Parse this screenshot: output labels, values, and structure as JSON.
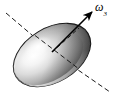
{
  "figure": {
    "type": "physics-diagram",
    "width": 115,
    "height": 99,
    "background_color": "#ffffff"
  },
  "ellipsoid": {
    "name": "shaded-ellipsoid",
    "center_x": 52,
    "center_y": 55,
    "semi_major": 42,
    "semi_minor": 27,
    "rotation_deg": -31,
    "outline_color": "#1a1a1a",
    "outline_width": 1.1,
    "highlight_color": "#ffffff",
    "midtone_color": "#c9c9c9",
    "shadow_color": "#4a4a4a",
    "deep_shadow_color": "#2e2e2e",
    "specular_x_frac": 0.34,
    "specular_y_frac": 0.4
  },
  "dashed_axis": {
    "name": "symmetry-axis-dashed-line",
    "x1": 6,
    "y1": 13,
    "x2": 110,
    "y2": 92,
    "color": "#1a1a1a",
    "width": 1.0,
    "dash_pattern": "5,3"
  },
  "dashed_secondary": {
    "name": "secondary-axis-dashed-segment",
    "x1": 52,
    "y1": 52,
    "x2": 79,
    "y2": 28,
    "color": "#1a1a1a",
    "width": 1.0,
    "dash_pattern": "4,3"
  },
  "omega_arrow": {
    "name": "angular-velocity-arrow",
    "x1": 52,
    "y1": 52,
    "x2": 94,
    "y2": 10,
    "color": "#000000",
    "width": 1.6,
    "head_length": 9,
    "head_width": 5
  },
  "labels": {
    "omega": {
      "symbol": "ω",
      "subscript": "3",
      "x": 96,
      "y": 2
    }
  },
  "colors": {
    "ink": "#1a1a1a",
    "paper": "#ffffff",
    "accent": "#000000"
  }
}
